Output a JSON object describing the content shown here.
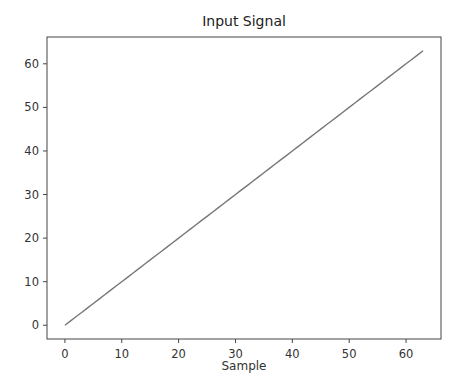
{
  "chart_data": {
    "type": "line",
    "title": "Input Signal",
    "xlabel": "Sample",
    "ylabel": "",
    "x": [
      0,
      1,
      2,
      3,
      4,
      5,
      6,
      7,
      8,
      9,
      10,
      11,
      12,
      13,
      14,
      15,
      16,
      17,
      18,
      19,
      20,
      21,
      22,
      23,
      24,
      25,
      26,
      27,
      28,
      29,
      30,
      31,
      32,
      33,
      34,
      35,
      36,
      37,
      38,
      39,
      40,
      41,
      42,
      43,
      44,
      45,
      46,
      47,
      48,
      49,
      50,
      51,
      52,
      53,
      54,
      55,
      56,
      57,
      58,
      59,
      60,
      61,
      62,
      63
    ],
    "series": [
      {
        "name": "Input Signal",
        "color": "#777777",
        "values": [
          0,
          1,
          2,
          3,
          4,
          5,
          6,
          7,
          8,
          9,
          10,
          11,
          12,
          13,
          14,
          15,
          16,
          17,
          18,
          19,
          20,
          21,
          22,
          23,
          24,
          25,
          26,
          27,
          28,
          29,
          30,
          31,
          32,
          33,
          34,
          35,
          36,
          37,
          38,
          39,
          40,
          41,
          42,
          43,
          44,
          45,
          46,
          47,
          48,
          49,
          50,
          51,
          52,
          53,
          54,
          55,
          56,
          57,
          58,
          59,
          60,
          61,
          62,
          63
        ]
      }
    ],
    "xticks": [
      0,
      10,
      20,
      30,
      40,
      50,
      60
    ],
    "yticks": [
      0,
      10,
      20,
      30,
      40,
      50,
      60
    ],
    "xlim": [
      -3.15,
      66.15
    ],
    "ylim": [
      -3.15,
      66.15
    ],
    "grid": false,
    "legend": null
  }
}
